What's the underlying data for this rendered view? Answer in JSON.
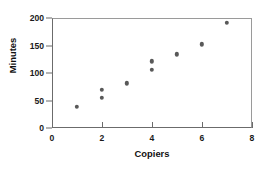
{
  "chart_data": {
    "type": "scatter",
    "title": "",
    "xlabel": "Copiers",
    "ylabel": "Minutes",
    "xlim": [
      0,
      8
    ],
    "ylim": [
      0,
      200
    ],
    "xticks": [
      0,
      2,
      4,
      6,
      8
    ],
    "yticks": [
      0,
      50,
      100,
      150,
      200
    ],
    "xtick_labels": [
      "0",
      "2",
      "4",
      "6",
      "8"
    ],
    "ytick_labels": [
      "0",
      "50",
      "100",
      "150",
      "200"
    ],
    "grid": false,
    "legend": null,
    "series": [
      {
        "name": "Service calls",
        "marker": "circle",
        "color": "#595959",
        "points": [
          {
            "x": 1,
            "y": 38
          },
          {
            "x": 2,
            "y": 55
          },
          {
            "x": 2,
            "y": 69
          },
          {
            "x": 3,
            "y": 81
          },
          {
            "x": 4,
            "y": 106
          },
          {
            "x": 4,
            "y": 121
          },
          {
            "x": 5,
            "y": 134
          },
          {
            "x": 6,
            "y": 152
          },
          {
            "x": 7,
            "y": 191
          }
        ]
      }
    ]
  },
  "colors": {
    "marker": "#595959",
    "axis": "#6b6b6b",
    "frame": "#9a9a9a",
    "text": "#111111",
    "background": "#ffffff"
  }
}
